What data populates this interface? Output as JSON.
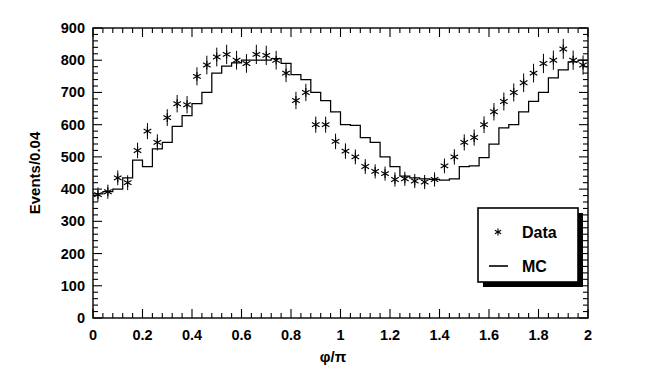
{
  "chart_data": {
    "type": "line",
    "title": "",
    "xlabel": "φ/π",
    "ylabel": "Events/0.04",
    "xlim": [
      0,
      2
    ],
    "ylim": [
      0,
      900
    ],
    "grid": false,
    "bin_width": 0.04,
    "xticks": [
      0,
      0.2,
      0.4,
      0.6,
      0.8,
      1,
      1.2,
      1.4,
      1.6,
      1.8,
      2
    ],
    "xtick_labels": [
      "0",
      "0.2",
      "0.4",
      "0.6",
      "0.8",
      "1",
      "1.2",
      "1.4",
      "1.6",
      "1.8",
      "2"
    ],
    "yticks": [
      0,
      100,
      200,
      300,
      400,
      500,
      600,
      700,
      800,
      900
    ],
    "ytick_labels": [
      "0",
      "100",
      "200",
      "300",
      "400",
      "500",
      "600",
      "700",
      "800",
      "900"
    ],
    "x_minor_tick_count": 4,
    "y_minor_tick_count": 4,
    "legend": {
      "position": "lower-right-inside",
      "entries": [
        {
          "label": "Data",
          "marker": "asterisk"
        },
        {
          "label": "MC",
          "marker": "line"
        }
      ]
    },
    "series": [
      {
        "name": "MC",
        "style": "step-histogram",
        "bin_centers": [
          0.02,
          0.06,
          0.1,
          0.14,
          0.18,
          0.22,
          0.26,
          0.3,
          0.34,
          0.38,
          0.42,
          0.46,
          0.5,
          0.54,
          0.58,
          0.62,
          0.66,
          0.7,
          0.74,
          0.78,
          0.82,
          0.86,
          0.9,
          0.94,
          0.98,
          1.02,
          1.06,
          1.1,
          1.14,
          1.18,
          1.22,
          1.26,
          1.3,
          1.34,
          1.38,
          1.42,
          1.46,
          1.5,
          1.54,
          1.58,
          1.62,
          1.66,
          1.7,
          1.74,
          1.78,
          1.82,
          1.86,
          1.9,
          1.94,
          1.98
        ],
        "values": [
          385,
          392,
          400,
          435,
          490,
          470,
          525,
          545,
          595,
          628,
          665,
          700,
          760,
          782,
          792,
          800,
          800,
          800,
          805,
          790,
          755,
          740,
          700,
          675,
          640,
          600,
          598,
          560,
          545,
          500,
          470,
          440,
          435,
          432,
          430,
          428,
          432,
          470,
          472,
          498,
          540,
          590,
          600,
          640,
          672,
          700,
          745,
          770,
          795,
          800
        ]
      },
      {
        "name": "Data",
        "style": "points-with-errors",
        "bin_centers": [
          0.02,
          0.06,
          0.1,
          0.14,
          0.18,
          0.22,
          0.26,
          0.3,
          0.34,
          0.38,
          0.42,
          0.46,
          0.5,
          0.54,
          0.58,
          0.62,
          0.66,
          0.7,
          0.74,
          0.78,
          0.82,
          0.86,
          0.9,
          0.94,
          0.98,
          1.02,
          1.06,
          1.1,
          1.14,
          1.18,
          1.22,
          1.26,
          1.3,
          1.34,
          1.38,
          1.42,
          1.46,
          1.5,
          1.54,
          1.58,
          1.62,
          1.66,
          1.7,
          1.74,
          1.78,
          1.82,
          1.86,
          1.9,
          1.94,
          1.98
        ],
        "values": [
          383,
          392,
          435,
          420,
          520,
          580,
          545,
          622,
          665,
          662,
          750,
          785,
          810,
          818,
          800,
          790,
          818,
          815,
          800,
          760,
          675,
          700,
          600,
          600,
          548,
          518,
          500,
          470,
          455,
          448,
          430,
          432,
          425,
          422,
          430,
          472,
          500,
          545,
          560,
          600,
          640,
          672,
          700,
          730,
          760,
          790,
          800,
          835,
          800,
          785
        ],
        "errors": [
          22,
          22,
          23,
          23,
          24,
          25,
          25,
          26,
          27,
          27,
          28,
          29,
          29,
          30,
          29,
          29,
          30,
          30,
          29,
          28,
          27,
          27,
          25,
          25,
          24,
          24,
          23,
          23,
          22,
          22,
          22,
          22,
          22,
          22,
          22,
          23,
          24,
          25,
          25,
          26,
          27,
          28,
          28,
          29,
          29,
          30,
          30,
          31,
          30,
          30
        ]
      }
    ]
  }
}
